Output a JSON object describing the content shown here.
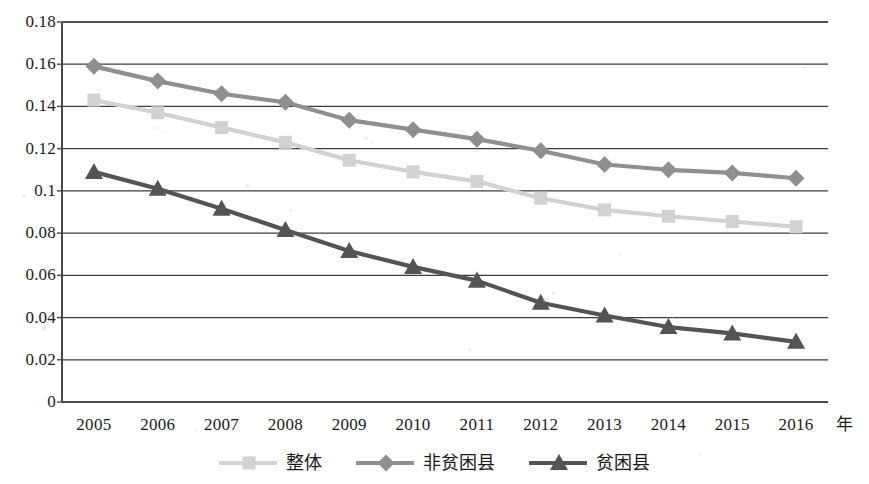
{
  "chart_data": {
    "type": "line",
    "title": "",
    "xlabel": "年",
    "ylabel": "",
    "categories": [
      "2005",
      "2006",
      "2007",
      "2008",
      "2009",
      "2010",
      "2011",
      "2012",
      "2013",
      "2014",
      "2015",
      "2016"
    ],
    "ylim": [
      0,
      0.18
    ],
    "yticks": [
      "0",
      "0.02",
      "0.04",
      "0.06",
      "0.08",
      "0.1",
      "0.12",
      "0.14",
      "0.16",
      "0.18"
    ],
    "ytick_values": [
      0,
      0.02,
      0.04,
      0.06,
      0.08,
      0.1,
      0.12,
      0.14,
      0.16,
      0.18
    ],
    "grid": true,
    "legend_position": "bottom",
    "series": [
      {
        "name": "整体",
        "color": "#d2d2d2",
        "marker": "square",
        "values": [
          0.143,
          0.137,
          0.13,
          0.123,
          0.1145,
          0.109,
          0.1045,
          0.0965,
          0.091,
          0.088,
          0.0855,
          0.083
        ]
      },
      {
        "name": "非贫困县",
        "color": "#8f8f8f",
        "marker": "diamond",
        "values": [
          0.159,
          0.152,
          0.146,
          0.142,
          0.1335,
          0.129,
          0.1245,
          0.119,
          0.1125,
          0.11,
          0.1085,
          0.106
        ]
      },
      {
        "name": "贫困县",
        "color": "#545454",
        "marker": "triangle",
        "values": [
          0.109,
          0.101,
          0.0915,
          0.0815,
          0.0715,
          0.064,
          0.0575,
          0.047,
          0.041,
          0.0355,
          0.0325,
          0.0285
        ]
      }
    ]
  },
  "axis": {
    "x_unit_label": "年"
  },
  "legend": {
    "items": [
      {
        "label": "整体",
        "color": "#d2d2d2",
        "marker": "square"
      },
      {
        "label": "非贫困县",
        "color": "#8f8f8f",
        "marker": "diamond"
      },
      {
        "label": "贫困县",
        "color": "#545454",
        "marker": "triangle"
      }
    ]
  },
  "colors": {
    "axis": "#4a4a4a",
    "grid": "#3c3c3c",
    "background": "#ffffff",
    "text": "#1b1b1b"
  }
}
